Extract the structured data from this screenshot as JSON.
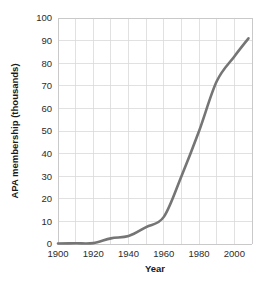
{
  "chart_data": {
    "type": "line",
    "title": "",
    "xlabel": "Year",
    "ylabel": "APA membership (thousands)",
    "xlim": [
      1900,
      2010
    ],
    "ylim": [
      0,
      100
    ],
    "grid": true,
    "legend": null,
    "x_ticks": [
      "1900",
      "1920",
      "1940",
      "1960",
      "1980",
      "2000"
    ],
    "x_tick_values": [
      1900,
      1920,
      1940,
      1960,
      1980,
      2000
    ],
    "x_minor_step": 10,
    "y_ticks": [
      "0",
      "10",
      "20",
      "30",
      "40",
      "50",
      "60",
      "70",
      "80",
      "90",
      "100"
    ],
    "y_tick_values": [
      0,
      10,
      20,
      30,
      40,
      50,
      60,
      70,
      80,
      90,
      100
    ],
    "line_color": "#757575",
    "grid_color": "#d9d9d9",
    "series": [
      {
        "name": "APA membership",
        "x": [
          1900,
          1910,
          1920,
          1930,
          1940,
          1950,
          1960,
          1970,
          1980,
          1990,
          2000,
          2008
        ],
        "values": [
          0.2,
          0.3,
          0.4,
          2.5,
          3.5,
          7.5,
          12,
          30,
          50,
          72,
          83,
          91
        ]
      }
    ]
  },
  "axis": {
    "x_title": "Year",
    "y_title": "APA membership (thousands)"
  }
}
